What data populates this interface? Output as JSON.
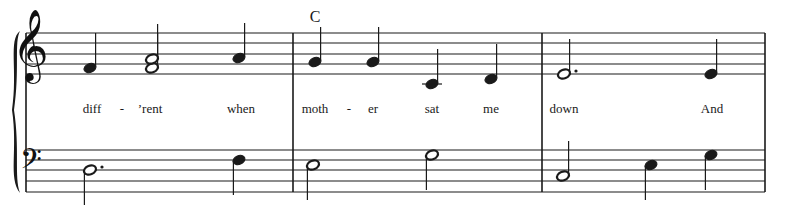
{
  "score": {
    "staff_left": 26,
    "staff_right": 765,
    "treble_lines_y": [
      33,
      43,
      54,
      64,
      74
    ],
    "bass_lines_y": [
      150,
      160,
      170,
      181,
      192
    ],
    "barlines_x": [
      26,
      293,
      542,
      765
    ],
    "ink_color": "#1a1a1a",
    "chord_symbols": [
      {
        "label": "C",
        "x": 315
      }
    ],
    "lyrics": [
      {
        "text": "diff",
        "x": 92
      },
      {
        "text": "-",
        "x": 122
      },
      {
        "text": "’rent",
        "x": 150
      },
      {
        "text": "when",
        "x": 241
      },
      {
        "text": "moth",
        "x": 315
      },
      {
        "text": "-",
        "x": 349
      },
      {
        "text": "er",
        "x": 373
      },
      {
        "text": "sat",
        "x": 432
      },
      {
        "text": "me",
        "x": 491
      },
      {
        "text": "down",
        "x": 564
      },
      {
        "text": "And",
        "x": 712
      }
    ],
    "treble_notes": [
      {
        "x": 90,
        "y": 68,
        "type": "quarter",
        "stem": "up",
        "pitch": "F4"
      },
      {
        "x": 152,
        "y": 68,
        "type": "half",
        "stem": "up",
        "pitch": "F4"
      },
      {
        "x": 152,
        "y": 59,
        "type": "half",
        "stem": "up",
        "pitch": "A4"
      },
      {
        "x": 239,
        "y": 58,
        "type": "quarter",
        "stem": "up",
        "pitch": "A4"
      },
      {
        "x": 315,
        "y": 62,
        "type": "quarter",
        "stem": "up",
        "pitch": "G4"
      },
      {
        "x": 373,
        "y": 62,
        "type": "quarter",
        "stem": "up",
        "pitch": "G4"
      },
      {
        "x": 432,
        "y": 84,
        "type": "quarter",
        "stem": "up",
        "pitch": "C4",
        "ledger": true
      },
      {
        "x": 491,
        "y": 79,
        "type": "quarter",
        "stem": "up",
        "pitch": "D4"
      },
      {
        "x": 564,
        "y": 74,
        "type": "dotted-half",
        "stem": "up",
        "pitch": "E4"
      },
      {
        "x": 711,
        "y": 74,
        "type": "quarter",
        "stem": "up",
        "pitch": "E4"
      }
    ],
    "bass_notes": [
      {
        "x": 90,
        "y": 170,
        "type": "dotted-half",
        "stem": "down",
        "pitch": "D3"
      },
      {
        "x": 239,
        "y": 160,
        "type": "quarter",
        "stem": "down",
        "pitch": "F3"
      },
      {
        "x": 313,
        "y": 165,
        "type": "half",
        "stem": "down",
        "pitch": "E3"
      },
      {
        "x": 432,
        "y": 155,
        "type": "half",
        "stem": "down",
        "pitch": "G3"
      },
      {
        "x": 563,
        "y": 176,
        "type": "half",
        "stem": "up",
        "pitch": "C3"
      },
      {
        "x": 651,
        "y": 165,
        "type": "quarter",
        "stem": "down",
        "pitch": "E3"
      },
      {
        "x": 711,
        "y": 155,
        "type": "quarter",
        "stem": "down",
        "pitch": "G3"
      }
    ],
    "clefs": {
      "treble": "𝄞",
      "bass": "𝄢"
    }
  }
}
